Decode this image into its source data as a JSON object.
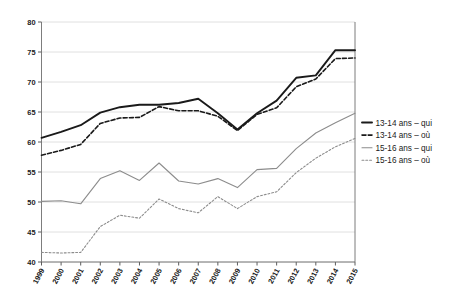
{
  "chart_data": {
    "type": "line",
    "title": "",
    "subtitle": "",
    "xlabel": "",
    "ylabel": "",
    "grid": true,
    "legend_position": "right",
    "ylim": [
      40,
      80
    ],
    "yticks": [
      40,
      45,
      50,
      55,
      60,
      65,
      70,
      75,
      80
    ],
    "categories": [
      "1999",
      "2000",
      "2001",
      "2002",
      "2003",
      "2004",
      "2005",
      "2006",
      "2007",
      "2008",
      "2009",
      "2010",
      "2011",
      "2012",
      "2013",
      "2014",
      "2015"
    ],
    "series": [
      {
        "name": "13-14 ans – qui",
        "style": "solid",
        "color": "#1a1a1a",
        "width": 1.9,
        "values": [
          60.7,
          61.7,
          62.8,
          64.9,
          65.8,
          66.2,
          66.2,
          66.5,
          67.2,
          64.8,
          62.1,
          64.8,
          66.9,
          70.7,
          71.1,
          75.3,
          75.3
        ]
      },
      {
        "name": "13-14 ans – où",
        "style": "dashed",
        "color": "#1a1a1a",
        "width": 1.6,
        "values": [
          57.8,
          58.6,
          59.6,
          63.1,
          64.0,
          64.1,
          65.9,
          65.2,
          65.2,
          64.3,
          61.9,
          64.6,
          65.7,
          69.2,
          70.5,
          73.9,
          74.0
        ]
      },
      {
        "name": "15-16 ans – qui",
        "style": "solid",
        "color": "#8c8c8c",
        "width": 1.1,
        "values": [
          50.1,
          50.2,
          49.7,
          53.9,
          55.2,
          53.6,
          56.5,
          53.5,
          53.0,
          53.9,
          52.4,
          55.4,
          55.6,
          58.9,
          61.5,
          63.2,
          64.8
        ]
      },
      {
        "name": "15-16 ans – où",
        "style": "dotted",
        "color": "#8c8c8c",
        "width": 1.1,
        "values": [
          41.6,
          41.5,
          41.6,
          45.9,
          47.8,
          47.3,
          50.5,
          48.9,
          48.2,
          50.9,
          48.9,
          50.9,
          51.7,
          54.9,
          57.3,
          59.2,
          60.6
        ]
      }
    ]
  },
  "legend": {
    "items": [
      {
        "label": "13-14 ans – qui"
      },
      {
        "label": "13-14 ans – où"
      },
      {
        "label": "15-16 ans – qui"
      },
      {
        "label": "15-16 ans – où"
      }
    ]
  }
}
